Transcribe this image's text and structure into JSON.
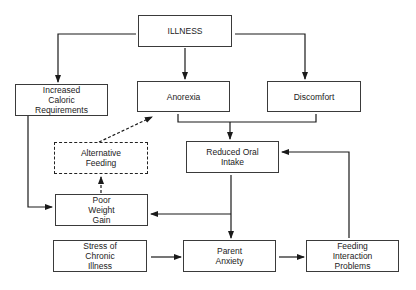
{
  "diagram": {
    "nodes": [
      {
        "id": "illness",
        "label": "ILLNESS",
        "x": 138,
        "y": 15,
        "w": 94,
        "h": 32,
        "style": "solid"
      },
      {
        "id": "increased-caloric",
        "label": "Increased\nCaloric\nRequirements",
        "x": 15,
        "y": 84,
        "w": 93,
        "h": 32,
        "style": "solid"
      },
      {
        "id": "anorexia",
        "label": "Anorexia",
        "x": 137,
        "y": 81,
        "w": 93,
        "h": 31,
        "style": "solid"
      },
      {
        "id": "discomfort",
        "label": "Discomfort",
        "x": 267,
        "y": 81,
        "w": 94,
        "h": 31,
        "style": "solid"
      },
      {
        "id": "alternative-feeding",
        "label": "Alternative\nFeeding",
        "x": 54,
        "y": 142,
        "w": 94,
        "h": 32,
        "style": "dashed"
      },
      {
        "id": "reduced-oral-intake",
        "label": "Reduced Oral\nIntake",
        "x": 186,
        "y": 141,
        "w": 93,
        "h": 32,
        "style": "solid"
      },
      {
        "id": "poor-weight-gain",
        "label": "Poor\nWeight\nGain",
        "x": 55,
        "y": 194,
        "w": 93,
        "h": 32,
        "style": "solid"
      },
      {
        "id": "stress-chronic-illness",
        "label": "Stress of\nChronic\nIllness",
        "x": 53,
        "y": 240,
        "w": 94,
        "h": 32,
        "style": "solid"
      },
      {
        "id": "parent-anxiety",
        "label": "Parent\nAnxiety",
        "x": 183,
        "y": 240,
        "w": 93,
        "h": 32,
        "style": "solid"
      },
      {
        "id": "feeding-interaction-problems",
        "label": "Feeding\nInteraction\nProblems",
        "x": 306,
        "y": 240,
        "w": 93,
        "h": 32,
        "style": "solid"
      }
    ],
    "edges": [
      {
        "from": "illness",
        "to": "increased-caloric",
        "style": "solid"
      },
      {
        "from": "illness",
        "to": "anorexia",
        "style": "solid"
      },
      {
        "from": "illness",
        "to": "discomfort",
        "style": "solid"
      },
      {
        "from": "anorexia+discomfort",
        "to": "reduced-oral-intake",
        "style": "solid"
      },
      {
        "from": "increased-caloric",
        "to": "poor-weight-gain",
        "style": "solid"
      },
      {
        "from": "reduced-oral-intake",
        "to": "poor-weight-gain",
        "style": "solid"
      },
      {
        "from": "reduced-oral-intake",
        "to": "parent-anxiety",
        "style": "solid"
      },
      {
        "from": "poor-weight-gain",
        "to": "alternative-feeding",
        "style": "dashed"
      },
      {
        "from": "alternative-feeding",
        "to": "anorexia",
        "style": "dashed"
      },
      {
        "from": "stress-chronic-illness",
        "to": "parent-anxiety",
        "style": "solid"
      },
      {
        "from": "parent-anxiety",
        "to": "feeding-interaction-problems",
        "style": "solid"
      },
      {
        "from": "feeding-interaction-problems",
        "to": "reduced-oral-intake",
        "style": "solid"
      }
    ],
    "colors": {
      "line": "#1a1a1a",
      "border": "#3a3a3a",
      "background": "#ffffff"
    }
  }
}
